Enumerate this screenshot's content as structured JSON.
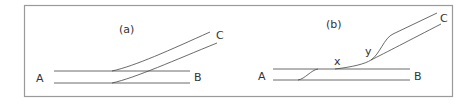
{
  "figure": {
    "panels": [
      {
        "id": "a",
        "caption": "(a)",
        "labels": {
          "left": "A",
          "right": "B",
          "branch": "C"
        }
      },
      {
        "id": "b",
        "caption": "(b)",
        "labels": {
          "left": "A",
          "right": "B",
          "branch": "C",
          "point_x": "x",
          "point_y": "y"
        }
      }
    ],
    "colors": {
      "border": "#999999",
      "line": "#444444",
      "text": "#333333"
    }
  }
}
